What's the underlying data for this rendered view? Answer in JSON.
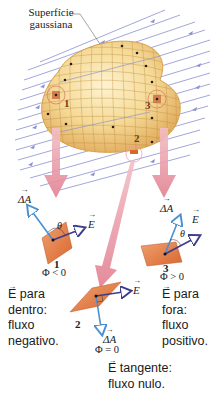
{
  "surface_label": {
    "line1": "Superfície",
    "line2": "gaussiana"
  },
  "surface_markers": [
    "1",
    "2",
    "3"
  ],
  "patches": [
    {
      "id": "1",
      "normal_label": "ΔA",
      "field_label": "E",
      "angle_label": "θ",
      "number": "1",
      "flux": "Φ < 0"
    },
    {
      "id": "2",
      "normal_label": "ΔA",
      "field_label": "E",
      "number": "2",
      "flux": "Φ = 0"
    },
    {
      "id": "3",
      "normal_label": "ΔA",
      "field_label": "E",
      "angle_label": "θ",
      "number": "3",
      "flux": "Φ > 0"
    }
  ],
  "captions": {
    "inward": {
      "vector": "E",
      "line1": " para",
      "line2": "dentro:",
      "line3": "fluxo",
      "line4": "negativo."
    },
    "outward": {
      "vector": "E",
      "line1": " para",
      "line2": "fora:",
      "line3": "fluxo",
      "line4": "positivo."
    },
    "tangent": {
      "vector": "E",
      "line1": " tangente:",
      "line2": "fluxo nulo."
    }
  },
  "colors": {
    "field_lines": "#7b80c8",
    "surface_fill": "#f3d28a",
    "surface_edge": "#d9a24a",
    "pointer_arrow": "#e48a98",
    "patch": "#e07a3c",
    "normal_vector": "#4a8fcf",
    "field_vector": "#3c3c8c"
  }
}
